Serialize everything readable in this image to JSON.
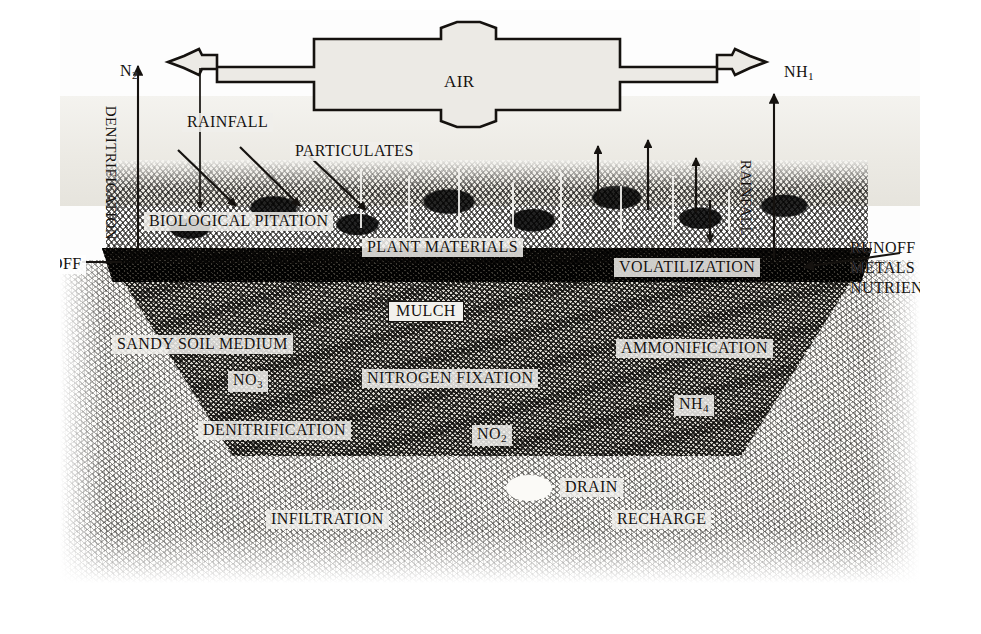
{
  "atmosphere": {
    "air_label": "AIR",
    "left_gas": "N",
    "left_gas_sub": "2",
    "right_gas": "NH",
    "right_gas_sub": "1"
  },
  "processes": {
    "denitrification_vertical": "DENITRIFICATION",
    "rainfall_left": "RAINFALL",
    "rainfall_right": "RAINFALL",
    "particulates": "PARTICULATES",
    "biological_pitation": "BIOLOGICAL PITATION",
    "plant_materials": "PLANT MATERIALS",
    "volatilization": "VOLATILIZATION",
    "mulch": "MULCH",
    "sandy_soil_medium": "SANDY SOIL MEDIUM",
    "ammonification": "AMMONIFICATION",
    "nitrogen_fixation": "NITROGEN FIXATION",
    "denitrification_soil": "DENITRIFICATION",
    "infiltration": "INFILTRATION",
    "recharge": "RECHARGE",
    "drain": "DRAIN"
  },
  "inputs": {
    "runoff_left": "RUNOFF"
  },
  "outputs": {
    "line1": "RUNOFF",
    "line2": "METALS",
    "line3": "NUTRIENTS"
  },
  "species": [
    {
      "formula": "NO",
      "sub": "3"
    },
    {
      "formula": "NO",
      "sub": "2"
    },
    {
      "formula": "NH",
      "sub": "4"
    }
  ],
  "colors": {
    "ink": "#15120f",
    "paper": "#ffffff",
    "plate": "#fdfdfd",
    "label_wash": "#f0efeb",
    "soil_dark": "#3a3731",
    "soil_mid": "#d8d5cd"
  }
}
